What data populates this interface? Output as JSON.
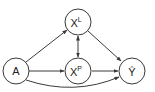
{
  "diagram": {
    "type": "causal-graph",
    "nodes": [
      {
        "id": "A",
        "label": "A",
        "sup": "",
        "cx": 16,
        "cy": 71
      },
      {
        "id": "XL",
        "label": "X",
        "sup": "L",
        "cx": 78,
        "cy": 22
      },
      {
        "id": "XP",
        "label": "X",
        "sup": "P",
        "cx": 78,
        "cy": 71
      },
      {
        "id": "Yhat",
        "label": "Ŷ",
        "sup": "",
        "cx": 132,
        "cy": 71
      }
    ],
    "edges": [
      {
        "from": "A",
        "to": "XL",
        "style": "directed"
      },
      {
        "from": "A",
        "to": "XP",
        "style": "directed"
      },
      {
        "from": "A",
        "to": "Yhat",
        "style": "directed-curved"
      },
      {
        "from": "XL",
        "to": "XP",
        "style": "bidirected"
      },
      {
        "from": "XL",
        "to": "Yhat",
        "style": "directed"
      },
      {
        "from": "XP",
        "to": "Yhat",
        "style": "directed"
      }
    ],
    "colors": {
      "stroke": "#3a3a3a",
      "text": "#222222",
      "background": "#ffffff"
    }
  }
}
